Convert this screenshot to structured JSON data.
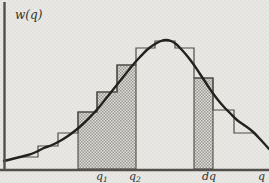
{
  "figure_title": "probability-density-with-histogram",
  "colors": {
    "background": "#e9e8e4",
    "paper_dot": "#e3e2de",
    "curve": "#24221f",
    "outline": "#4e4c48",
    "axis": "#53504c",
    "shade_bg": "#e0ded9",
    "shade_dot": "#9b9993",
    "text": "#33312d"
  },
  "chart_data": {
    "type": "line",
    "title": "",
    "xlabel": "q",
    "ylabel": "w(q)",
    "gridlines": false,
    "legend": false,
    "x_tick_labels": [
      {
        "base": "q",
        "sub": "1"
      },
      {
        "base": "q",
        "sub": "2"
      },
      {
        "base": "dq",
        "sub": ""
      }
    ],
    "histogram_relative_heights": [
      0.09,
      0.18,
      0.28,
      0.44,
      0.6,
      0.81,
      0.94,
      1.0,
      0.94,
      0.71,
      0.46,
      0.28
    ],
    "shaded_regions": [
      "q1_to_q2",
      "dq_strip"
    ],
    "pixel_geometry": {
      "width": 269,
      "height": 183,
      "baseline_y": 169,
      "x_axis": {
        "x1": 0,
        "x2": 269,
        "y": 170
      },
      "y_axis": {
        "x": 4.5,
        "y1": 2,
        "y2": 171
      },
      "bin_edges": [
        19,
        38,
        58,
        78,
        97,
        117,
        136,
        155,
        175,
        194,
        213,
        234,
        253
      ],
      "bin_tops": [
        157,
        146,
        133,
        112,
        92,
        65,
        48,
        41,
        48,
        78,
        110,
        133
      ],
      "shaded_bin_indices": [
        3,
        4,
        5,
        9
      ],
      "curve_points": [
        [
          4,
          161
        ],
        [
          12,
          159
        ],
        [
          20,
          157
        ],
        [
          28,
          155
        ],
        [
          36,
          152
        ],
        [
          44,
          148
        ],
        [
          52,
          145
        ],
        [
          60,
          141
        ],
        [
          68,
          136
        ],
        [
          76,
          130
        ],
        [
          84,
          123
        ],
        [
          92,
          115
        ],
        [
          100,
          106
        ],
        [
          108,
          96
        ],
        [
          116,
          86
        ],
        [
          124,
          76
        ],
        [
          132,
          66
        ],
        [
          140,
          57
        ],
        [
          148,
          49
        ],
        [
          155,
          44
        ],
        [
          161,
          41
        ],
        [
          166,
          40
        ],
        [
          171,
          41
        ],
        [
          176,
          44
        ],
        [
          182,
          50
        ],
        [
          188,
          57
        ],
        [
          194,
          65
        ],
        [
          200,
          74
        ],
        [
          206,
          83
        ],
        [
          212,
          92
        ],
        [
          218,
          100
        ],
        [
          224,
          107
        ],
        [
          230,
          113
        ],
        [
          237,
          120
        ],
        [
          244,
          125
        ],
        [
          252,
          131
        ],
        [
          260,
          139
        ],
        [
          269,
          149
        ]
      ],
      "stroke_widths": {
        "curve": 2.4,
        "histogram": 1.2,
        "axis": 2.4,
        "shade": 1.1
      },
      "label_anchors": {
        "ylabel": [
          15,
          19
        ],
        "q1": [
          96,
          180
        ],
        "q2": [
          129,
          180
        ],
        "dq": [
          202,
          180
        ],
        "xlabel": [
          258,
          180
        ]
      },
      "font_sizes": {
        "ylabel": 12,
        "ticks": 11
      }
    }
  }
}
